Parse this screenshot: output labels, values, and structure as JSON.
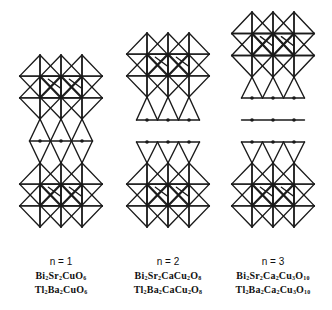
{
  "figure": {
    "stroke_color": "#1a1a1a",
    "background": "#ffffff",
    "structures": [
      {
        "id": "n1",
        "n_label": "n = 1",
        "formulas": [
          {
            "parts": [
              [
                "Bi",
                "2"
              ],
              [
                "Sr",
                "2"
              ],
              [
                "Cu",
                ""
              ],
              [
                "O",
                "6"
              ]
            ]
          },
          {
            "parts": [
              [
                "Tl",
                "2"
              ],
              [
                "Ba",
                "2"
              ],
              [
                "Cu",
                ""
              ],
              [
                "O",
                "6"
              ]
            ]
          }
        ],
        "centers_x": [
          40,
          61,
          82
        ],
        "label_center_x": 61,
        "blocks": [
          {
            "type": "octa_pair",
            "top": 55,
            "bottom": 119
          },
          {
            "type": "rhombus_layer",
            "top": 119,
            "mid": 141,
            "bottom": 163
          },
          {
            "type": "octa_pair",
            "top": 163,
            "bottom": 227
          }
        ]
      },
      {
        "id": "n2",
        "n_label": "n = 2",
        "formulas": [
          {
            "parts": [
              [
                "Bi",
                "2"
              ],
              [
                "Sr",
                "2"
              ],
              [
                "Ca",
                ""
              ],
              [
                "Cu",
                "2"
              ],
              [
                "O",
                "8"
              ]
            ]
          },
          {
            "parts": [
              [
                "Tl",
                "2"
              ],
              [
                "Ba",
                "2"
              ],
              [
                "Ca",
                ""
              ],
              [
                "Cu",
                "2"
              ],
              [
                "O",
                "8"
              ]
            ]
          }
        ],
        "centers_x": [
          147,
          168,
          189
        ],
        "label_center_x": 168,
        "blocks": [
          {
            "type": "octa_pair",
            "top": 33,
            "bottom": 97
          },
          {
            "type": "pyramid_down",
            "top": 97,
            "base": 120
          },
          {
            "type": "pyramid_up",
            "base": 142,
            "top": 163
          },
          {
            "type": "octa_pair",
            "top": 163,
            "bottom": 227
          }
        ]
      },
      {
        "id": "n3",
        "n_label": "n = 3",
        "formulas": [
          {
            "parts": [
              [
                "Bi",
                "2"
              ],
              [
                "Sr",
                "2"
              ],
              [
                "Ca",
                "2"
              ],
              [
                "Cu",
                "3"
              ],
              [
                "O",
                "10"
              ]
            ]
          },
          {
            "parts": [
              [
                "Tl",
                "2"
              ],
              [
                "Ba",
                "2"
              ],
              [
                "Ca",
                "2"
              ],
              [
                "Cu",
                "3"
              ],
              [
                "O",
                "10"
              ]
            ]
          }
        ],
        "centers_x": [
          252,
          273,
          294
        ],
        "label_center_x": 273,
        "blocks": [
          {
            "type": "octa_pair",
            "top": 12,
            "bottom": 77
          },
          {
            "type": "pyramid_down",
            "top": 77,
            "base": 98
          },
          {
            "type": "atom_line",
            "y": 120
          },
          {
            "type": "pyramid_up",
            "base": 142,
            "top": 163
          },
          {
            "type": "octa_pair",
            "top": 163,
            "bottom": 227
          }
        ]
      }
    ],
    "label_rows_y": {
      "n": 257,
      "formula1": 271,
      "formula2": 285
    }
  }
}
